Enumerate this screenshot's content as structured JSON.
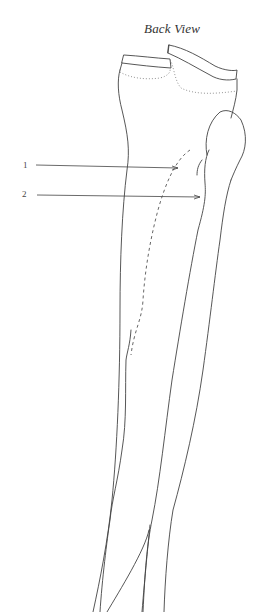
{
  "diagram": {
    "title": "Back View",
    "labels": [
      {
        "id": "1",
        "text": "1"
      },
      {
        "id": "2",
        "text": "2"
      }
    ],
    "colors": {
      "line": "#444444",
      "background": "#ffffff"
    }
  }
}
